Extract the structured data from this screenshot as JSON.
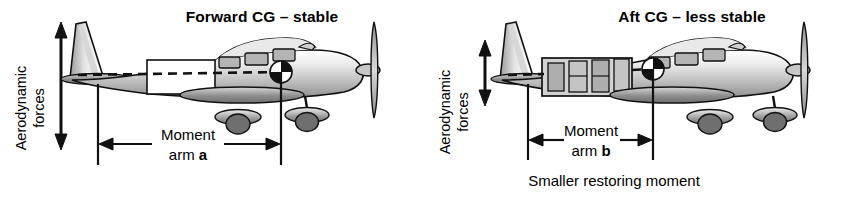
{
  "figure": {
    "type": "technical-diagram",
    "background_color": "#ffffff",
    "line_color": "#111111",
    "panel_count": 2
  },
  "panels": [
    {
      "id": "forward-cg",
      "title": "Forward CG – stable",
      "aerodynamic_label_line1": "Aerodynamic",
      "aerodynamic_label_line2": "forces",
      "moment_label_line1": "Moment",
      "moment_label_line2_prefix": "arm ",
      "moment_label_line2_symbol": "a",
      "caption": "",
      "force_arrow_relative_length": "long",
      "moment_arm_symbol": "a",
      "cg_marker": "quartered-circle",
      "load_area": "empty-forward-box",
      "stability": "stable"
    },
    {
      "id": "aft-cg",
      "title": "Aft CG – less stable",
      "aerodynamic_label_line1": "Aerodynamic",
      "aerodynamic_label_line2": "forces",
      "moment_label_line1": "Moment",
      "moment_label_line2_prefix": "arm ",
      "moment_label_line2_symbol": "b",
      "caption": "Smaller restoring moment",
      "force_arrow_relative_length": "short",
      "moment_arm_symbol": "b",
      "cg_marker": "quartered-circle",
      "load_area": "loaded-aft-compartment",
      "stability": "less stable"
    }
  ],
  "colors": {
    "ink": "#111111",
    "fuselage_light": "#f2f2f2",
    "fuselage_mid": "#c9c9c9",
    "fuselage_dark": "#8a8a8a",
    "wing_dark": "#7d7d7d",
    "window_fill": "#b4b4b4",
    "paper": "#ffffff"
  }
}
